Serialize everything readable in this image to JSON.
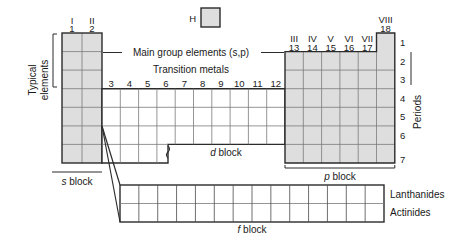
{
  "diagram": {
    "title_note": "Periodic table block structure diagram",
    "colors": {
      "shade": "#dedede",
      "line_outer": "#2b2b2b",
      "line_inner": "#6f6f6f",
      "text": "#1a1a1a"
    },
    "group_labels_roman_left": [
      "I",
      "II"
    ],
    "group_labels_num_left": [
      "1",
      "2"
    ],
    "group_labels_num_middle": [
      "3",
      "4",
      "5",
      "6",
      "7",
      "8",
      "9",
      "10",
      "11",
      "12"
    ],
    "group_labels_roman_right": [
      "III",
      "IV",
      "V",
      "VI",
      "VII"
    ],
    "group_labels_num_right": [
      "13",
      "14",
      "15",
      "16",
      "17"
    ],
    "group_label_roman_noble": "VIII",
    "group_label_num_noble": "18",
    "period_labels": [
      "1",
      "2",
      "3",
      "4",
      "5",
      "6",
      "7"
    ],
    "periods_axis_label": "Periods",
    "typical_elements_label_line1": "Typical",
    "typical_elements_label_line2": "elements",
    "hydrogen_symbol": "H",
    "callout_main_group": "Main group elements (s,p)",
    "callout_transition_metals": "Transition metals",
    "block_s_italic": "s",
    "block_s_word": "block",
    "block_d_italic": "d",
    "block_d_word": "block",
    "block_p_italic": "p",
    "block_p_word": "block",
    "block_f_italic": "f",
    "block_f_word": "block",
    "series_lanthanides": "Lanthanides",
    "series_actinides": "Actinides",
    "f_block_columns": 14,
    "f_block_rows": 2
  }
}
